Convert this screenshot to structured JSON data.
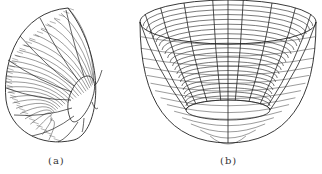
{
  "figures": [
    {
      "id": "a",
      "caption": "(a)",
      "description": "Wireframe bowl surface viewed obliquely from the side"
    },
    {
      "id": "b",
      "caption": "(b)",
      "description": "Wireframe bowl surface viewed from above at an angle"
    }
  ],
  "colors": {
    "line": "#222222",
    "background": "#ffffff"
  }
}
